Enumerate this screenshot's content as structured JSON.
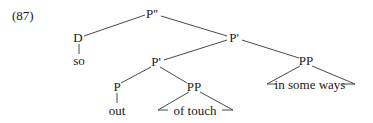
{
  "example_number": "(87)",
  "nodes": {
    "root": {
      "label": "P''",
      "x": 152,
      "y": 14
    },
    "d": {
      "label": "D",
      "x": 78,
      "y": 38
    },
    "so": {
      "label": "so",
      "x": 79,
      "y": 61
    },
    "pbar_top": {
      "label": "P'",
      "x": 234,
      "y": 38
    },
    "pbar_low": {
      "label": "P'",
      "x": 156,
      "y": 62
    },
    "pp_right": {
      "label": "PP",
      "x": 306,
      "y": 61
    },
    "in_some_ways": {
      "label": "in some ways",
      "x": 310,
      "y": 85
    },
    "p_out": {
      "label": "P",
      "x": 117,
      "y": 87
    },
    "out": {
      "label": "out",
      "x": 117,
      "y": 111
    },
    "pp_touch": {
      "label": "PP",
      "x": 194,
      "y": 87
    },
    "of_touch": {
      "label": "of touch",
      "x": 195,
      "y": 111
    }
  }
}
